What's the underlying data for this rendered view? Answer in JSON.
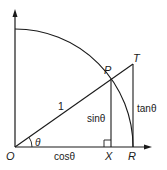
{
  "diagram": {
    "colors": {
      "stroke": "#1a1a1a",
      "background": "#ffffff"
    },
    "points": {
      "O": {
        "label": "O"
      },
      "P": {
        "label": "P"
      },
      "T": {
        "label": "T"
      },
      "X": {
        "label": "X"
      },
      "R": {
        "label": "R"
      }
    },
    "segment_labels": {
      "radius": "1",
      "angle": "θ",
      "cos": "cosθ",
      "sin": "sinθ",
      "tan": "tanθ"
    }
  }
}
